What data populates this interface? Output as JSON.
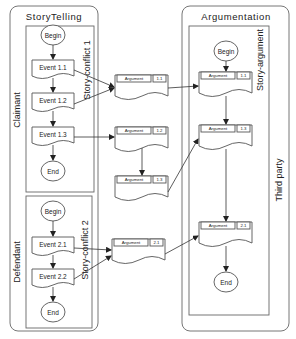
{
  "panels": {
    "storytelling": {
      "title": "StoryTelling",
      "roles": [
        "Claimant",
        "Defendant"
      ],
      "lanes": [
        "Story-conflict 1",
        "Story-conflict 2"
      ]
    },
    "argumentation": {
      "title": "Argumentation",
      "lanes": [
        "Story-argument",
        "Third party"
      ]
    }
  },
  "nodes": {
    "begin": "Begin",
    "end": "End",
    "events": [
      "Event 1.1",
      "Event 1.2",
      "Event 1.3",
      "Event 2.1",
      "Event 2.2"
    ]
  },
  "arguments": {
    "label": "Argument",
    "middle_ids": [
      "1.1",
      "1.2",
      "1.3",
      "2.1"
    ],
    "right_ids": [
      "1.1",
      "1.3",
      "2.1"
    ]
  }
}
